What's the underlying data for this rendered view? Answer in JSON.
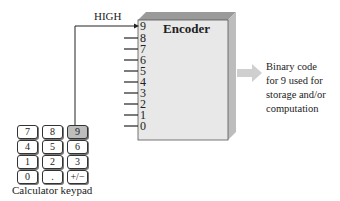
{
  "encoder": {
    "title": "Encoder",
    "inputs": [
      "9",
      "8",
      "7",
      "6",
      "5",
      "4",
      "3",
      "2",
      "1",
      "0"
    ],
    "active_input": "9"
  },
  "signal": {
    "label": "HIGH"
  },
  "output": {
    "text": "Binary code for 9 used for storage and/or computation",
    "lines": [
      "Binary code",
      "for 9 used for",
      "storage and/or",
      "computation"
    ]
  },
  "keypad": {
    "caption": "Calculator keypad",
    "rows": [
      [
        "7",
        "8",
        "9"
      ],
      [
        "4",
        "5",
        "6"
      ],
      [
        "1",
        "2",
        "3"
      ],
      [
        "0",
        ".",
        "+/−"
      ]
    ],
    "pressed_key": "9"
  },
  "colors": {
    "box_front": "#e6e6e6",
    "box_top": "#9a9a9a",
    "box_side": "#bdbdbd",
    "arrow": "#cfcfcf",
    "pressed_key": "#bdbdbd"
  }
}
